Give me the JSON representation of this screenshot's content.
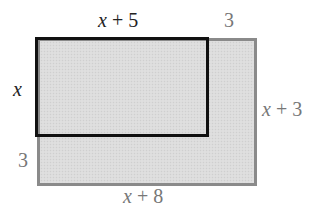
{
  "diagram": {
    "title": "",
    "shapes": {
      "outer_rectangle": {
        "description": "Large shaded rectangle",
        "width_label": "x + 8",
        "height_label": "x + 3",
        "border_color": "#8a8a8a",
        "fill_color": "#dcdcdc"
      },
      "inner_rectangle": {
        "description": "Smaller rectangle inside the larger one, aligned at top-left",
        "width_label": "x + 5",
        "height_label": "x",
        "border_color": "#111111"
      }
    },
    "labels": {
      "top_inner_width": {
        "var": "x",
        "rest": " + 5"
      },
      "top_extra_width": "3",
      "left_inner_height": {
        "var": "x"
      },
      "left_extra_height": "3",
      "right_outer_height": {
        "var": "x",
        "rest": " + 3"
      },
      "bottom_outer_width": {
        "var": "x",
        "rest": " + 8"
      }
    }
  }
}
